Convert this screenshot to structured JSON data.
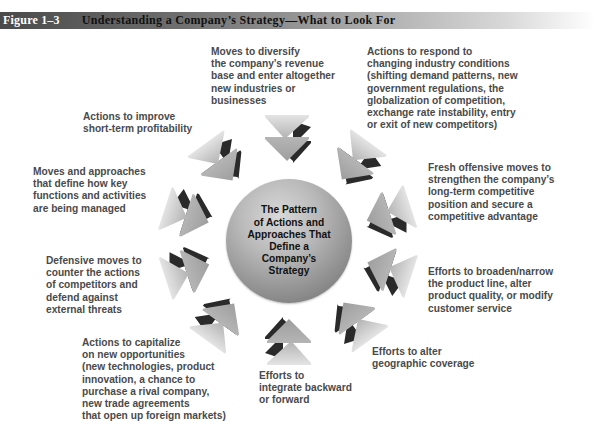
{
  "header": {
    "figure_number": "Figure 1–3",
    "title": "Understanding a Company’s Strategy—What to Look For"
  },
  "center": {
    "text": "The Pattern\nof Actions and\nApproaches That\nDefine a\nCompany’s\nStrategy"
  },
  "labels": [
    {
      "id": "diversify",
      "text": "Moves to diversify\nthe company’s revenue\nbase and enter altogether\nnew industries or\nbusinesses"
    },
    {
      "id": "respond",
      "text": "Actions to respond to\nchanging industry conditions\n(shifting demand patterns, new\ngovernment regulations, the\nglobalization of competition,\nexchange rate instability, entry\nor exit of new competitors)"
    },
    {
      "id": "offensive",
      "text": "Fresh offensive moves to\nstrengthen the company’s\nlong-term competitive\nposition and secure a\ncompetitive advantage"
    },
    {
      "id": "product-line",
      "text": "Efforts to broaden/narrow\nthe product line, alter\nproduct quality, or modify\ncustomer service"
    },
    {
      "id": "geographic",
      "text": "Efforts to alter\ngeographic coverage"
    },
    {
      "id": "integrate",
      "text": "Efforts to\nintegrate backward\nor forward"
    },
    {
      "id": "capitalize",
      "text": "Actions to capitalize\non new opportunities\n(new technologies, product\ninnovation, a chance to\npurchase a rival company,\nnew trade agreements\nthat open up foreign markets)"
    },
    {
      "id": "defensive",
      "text": "Defensive moves to\ncounter the actions\nof competitors and\ndefend against\nexternal threats"
    },
    {
      "id": "functions",
      "text": "Moves and approaches\nthat define how key\nfunctions and activities\nare being managed"
    },
    {
      "id": "profitability",
      "text": "Actions to improve\nshort-term profitability"
    }
  ],
  "arrows": {
    "count": 10,
    "icon": "double-chevron-arrow-icon",
    "face_color": "#b4b4b4",
    "shadow_color": "#2a2a2a"
  }
}
